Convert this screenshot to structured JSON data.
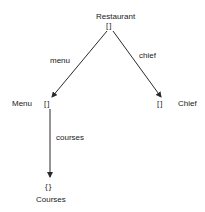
{
  "diagram": {
    "type": "object-tree",
    "nodes": [
      {
        "id": "restaurant",
        "label": "Restaurant",
        "marker": "[]"
      },
      {
        "id": "menu",
        "label": "Menu",
        "marker": "[]"
      },
      {
        "id": "chief",
        "label": "Chief",
        "marker": "[]"
      },
      {
        "id": "courses",
        "label": "Courses",
        "marker": "{}"
      }
    ],
    "edges": [
      {
        "from": "restaurant",
        "to": "menu",
        "label": "menu"
      },
      {
        "from": "restaurant",
        "to": "chief",
        "label": "chief"
      },
      {
        "from": "menu",
        "to": "courses",
        "label": "courses"
      }
    ]
  },
  "colors": {
    "line": "#2a2a2a",
    "text": "#1a1a1a",
    "background": "#ffffff"
  }
}
